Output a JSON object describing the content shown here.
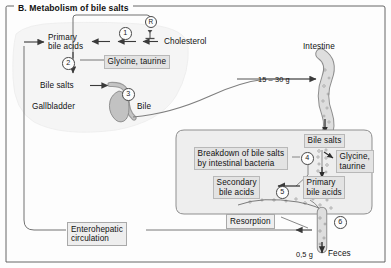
{
  "figure": {
    "panel_letter": "B.",
    "title": "B. Metabolism of bile salts",
    "domain": "biochemistry-pathway-diagram",
    "frame": {
      "style": "thin-rule-border-with-title-gap"
    }
  },
  "colors": {
    "background": "#fdfdfd",
    "stroke": "#585858",
    "organ_fill": "#c9c9c9",
    "organ_stroke": "#6b6b6b",
    "label_box_fill": "#e3e3e3",
    "label_box_stroke": "#b8b8b8",
    "plain_box_fill": "#eeeeee",
    "plain_box_stroke": "#a9a9a9",
    "liver_fill": "#f4f4f4",
    "intestine_lumen_fill": "#dcdcdc",
    "text": "#111111"
  },
  "labels": {
    "primary_bile_acids_liver": "Primary\nbile acids",
    "primary_bile_acids_liver_line1": "Primary",
    "primary_bile_acids_liver_line2": "bile acids",
    "cholesterol": "Cholesterol",
    "glycine_taurine_liver": "Glycine, taurine",
    "bile_salts_liver": "Bile salts",
    "gallbladder": "Gallbladder",
    "bile": "Bile",
    "intestine": "Intestine",
    "bile_salts_intestine": "Bile salts",
    "breakdown_line1": "Breakdown of bile salts",
    "breakdown_line2": "by intestinal bacteria",
    "glycine_taurine_gut_line1": "Glycine,",
    "glycine_taurine_gut_line2": "taurine",
    "primary_bile_acids_gut_line1": "Primary",
    "primary_bile_acids_gut_line2": "bile acids",
    "secondary_bile_acids_line1": "Secondary",
    "secondary_bile_acids_line2": "bile acids",
    "resorption": "Resorption",
    "enterohepatic_line1": "Enterohepatic",
    "enterohepatic_line2": "circulation",
    "feces": "Feces"
  },
  "quantities": {
    "bile_salts_secreted": "15 – 30 g",
    "feces_loss": "0,5 g"
  },
  "markers": {
    "regulation": "R",
    "step_1": "1",
    "step_2": "2",
    "step_3": "3",
    "step_4": "4",
    "step_5": "5",
    "step_6": "6"
  },
  "steps": [
    {
      "id": "1",
      "name": "cholesterol-to-primary-bile-acids",
      "enzyme_step": "7α-hydroxylation"
    },
    {
      "id": "2",
      "name": "conjugation-with-glycine-taurine"
    },
    {
      "id": "3",
      "name": "bile-secretion-via-gallbladder"
    },
    {
      "id": "4",
      "name": "deconjugation-by-intestinal-bacteria"
    },
    {
      "id": "5",
      "name": "dehydroxylation-to-secondary-bile-acids"
    },
    {
      "id": "6",
      "name": "fecal-excretion"
    }
  ],
  "flows": [
    {
      "from": "Cholesterol",
      "to": "Primary bile acids",
      "marker": "1"
    },
    {
      "from": "Primary bile acids",
      "to": "Bile salts",
      "marker": "2"
    },
    {
      "from": "Bile salts",
      "to": "Bile",
      "marker": "3"
    },
    {
      "from": "Bile",
      "to": "Intestine",
      "amount": "15 – 30 g"
    },
    {
      "from": "Bile salts",
      "to": "Glycine, taurine",
      "marker": "4"
    },
    {
      "from": "Primary bile acids",
      "to": "Secondary bile acids",
      "marker": "5"
    },
    {
      "from": "Intestine",
      "to": "Feces",
      "amount": "0,5 g",
      "marker": "6"
    },
    {
      "from": "Intestine",
      "to": "Primary bile acids",
      "via": "Enterohepatic circulation",
      "label": "Resorption"
    }
  ]
}
